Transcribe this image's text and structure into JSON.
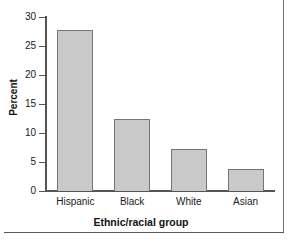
{
  "chart_data": {
    "type": "bar",
    "title": "",
    "subtitle": "",
    "xlabel": "Ethnic/racial group",
    "ylabel": "Percent",
    "categories": [
      "Hispanic",
      "Black",
      "White",
      "Asian"
    ],
    "values": [
      27.8,
      12.4,
      7.3,
      3.8
    ],
    "ylim": [
      0,
      30
    ],
    "yticks": [
      0,
      5,
      10,
      15,
      20,
      25,
      30
    ],
    "ytick_labels": [
      "0",
      "5",
      "10",
      "15",
      "20",
      "25",
      "30"
    ],
    "grid": false,
    "legend": null,
    "legend_position": "none",
    "annotations": [],
    "colors": {
      "bar_fill": "#c9c9c9",
      "bar_edge": "#757575",
      "axis": "#555555",
      "text": "#1a1a1a",
      "background": "#ffffff",
      "rule": "#5a5a5a"
    }
  }
}
